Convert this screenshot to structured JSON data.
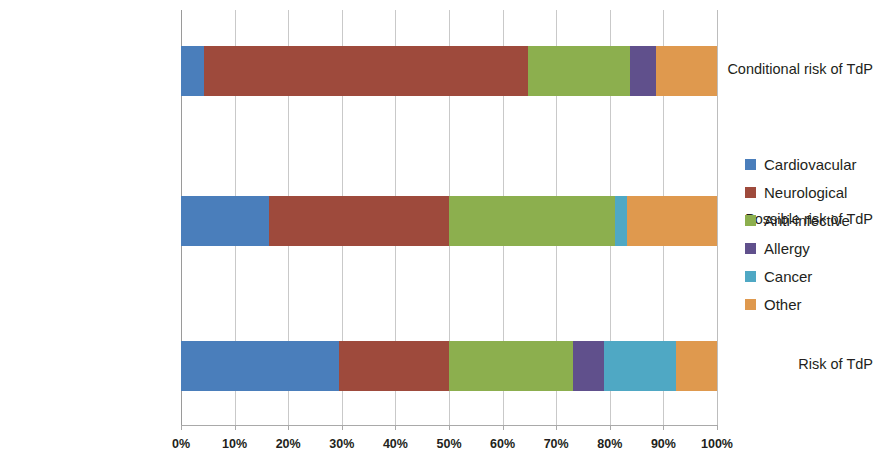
{
  "chart_data": {
    "type": "bar",
    "orientation": "horizontal",
    "stacked": true,
    "normalized_percent": true,
    "title": "",
    "xlabel": "",
    "ylabel": "",
    "xlim": [
      0,
      100
    ],
    "grid": true,
    "legend_position": "right",
    "categories": [
      "Conditional risk of TdP",
      "Possible risk of TdP",
      "Risk of TdP"
    ],
    "xtick_labels": [
      "0%",
      "10%",
      "20%",
      "30%",
      "40%",
      "50%",
      "60%",
      "70%",
      "80%",
      "90%",
      "100%"
    ],
    "xtick_values": [
      0,
      10,
      20,
      30,
      40,
      50,
      60,
      70,
      80,
      90,
      100
    ],
    "series": [
      {
        "name": "Cardiovacular",
        "color": "#4A7EBB",
        "values": [
          4.3,
          16.4,
          29.5
        ]
      },
      {
        "name": "Neurological",
        "color": "#9E4A3C",
        "values": [
          60.4,
          33.6,
          20.5
        ]
      },
      {
        "name": "Anti-infective",
        "color": "#8CAF4E",
        "values": [
          19.0,
          30.9,
          23.1
        ]
      },
      {
        "name": "Allergy",
        "color": "#60508C",
        "values": [
          4.9,
          0.0,
          5.9
        ]
      },
      {
        "name": "Cancer",
        "color": "#4FA8C4",
        "values": [
          0.0,
          2.3,
          13.3
        ]
      },
      {
        "name": "Other",
        "color": "#DF994E",
        "values": [
          11.4,
          16.8,
          7.7
        ]
      }
    ]
  },
  "legend": {
    "items": [
      {
        "label": "Cardiovacular",
        "color": "#4A7EBB"
      },
      {
        "label": "Neurological",
        "color": "#9E4A3C"
      },
      {
        "label": "Anti-infective",
        "color": "#8CAF4E"
      },
      {
        "label": "Allergy",
        "color": "#60508C"
      },
      {
        "label": "Cancer",
        "color": "#4FA8C4"
      },
      {
        "label": "Other",
        "color": "#DF994E"
      }
    ]
  }
}
